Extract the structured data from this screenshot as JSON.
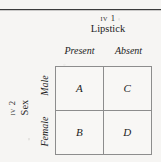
{
  "figure": {
    "top_rule": "horizontal-rule",
    "column_factor": {
      "iv_tag": "IV 1",
      "iv_name": "Lipstick",
      "levels": [
        "Present",
        "Absent"
      ]
    },
    "row_factor": {
      "iv_tag": "IV 2",
      "iv_name": "Sex",
      "levels": [
        "Male",
        "Female"
      ]
    },
    "cells": [
      {
        "id": "a",
        "label": "A",
        "row": "Male",
        "column": "Present"
      },
      {
        "id": "c",
        "label": "C",
        "row": "Male",
        "column": "Absent"
      },
      {
        "id": "b",
        "label": "B",
        "row": "Female",
        "column": "Present"
      },
      {
        "id": "d",
        "label": "D",
        "row": "Female",
        "column": "Absent"
      }
    ],
    "colors": {
      "background": "#f6f5f3",
      "rule": "#3b3b3b",
      "grid_line": "#8d8d8d",
      "text": "#1d1d1d",
      "cell_fill": "#f8f7f5"
    }
  }
}
